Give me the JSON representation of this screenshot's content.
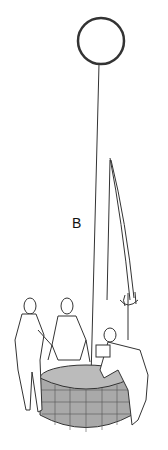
{
  "figure": {
    "label": "B"
  },
  "colors": {
    "line": "#222222",
    "well_fill": "#a9a9a9",
    "background": "#ffffff"
  }
}
